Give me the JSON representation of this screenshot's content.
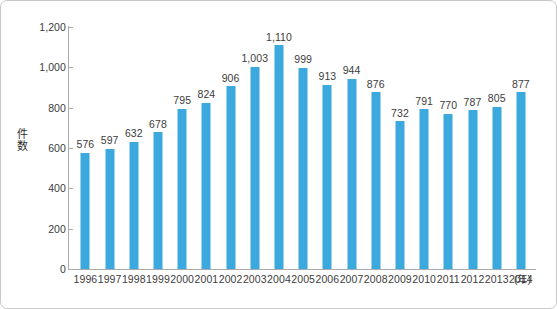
{
  "chart_data": {
    "type": "bar",
    "title": "",
    "xlabel": "(年)",
    "ylabel": "件数",
    "categories": [
      "1996",
      "1997",
      "1998",
      "1999",
      "2000",
      "2001",
      "2002",
      "2003",
      "2004",
      "2005",
      "2006",
      "2007",
      "2008",
      "2009",
      "2010",
      "2011",
      "2012",
      "2013",
      "2014"
    ],
    "values": [
      576,
      597,
      632,
      678,
      795,
      824,
      906,
      1003,
      1110,
      999,
      913,
      944,
      876,
      732,
      791,
      770,
      787,
      805,
      877
    ],
    "value_labels": [
      "576",
      "597",
      "632",
      "678",
      "795",
      "824",
      "906",
      "1,003",
      "1,110",
      "999",
      "913",
      "944",
      "876",
      "732",
      "791",
      "770",
      "787",
      "805",
      "877"
    ],
    "ylim": [
      0,
      1200
    ],
    "ytick_values": [
      0,
      200,
      400,
      600,
      800,
      1000,
      1200
    ],
    "ytick_labels": [
      "0",
      "200",
      "400",
      "600",
      "800",
      "1,000",
      "1,200"
    ],
    "grid": false,
    "legend": false,
    "bar_color": "#3ba9de",
    "axis_color": "#aaaaaa",
    "text_color": "#3c3c3c"
  },
  "axis": {
    "y_title_chars": [
      "件",
      "数"
    ],
    "x_unit": "(年)"
  },
  "frame": {
    "border_color": "#c9c9c9",
    "background": "#ffffff"
  }
}
